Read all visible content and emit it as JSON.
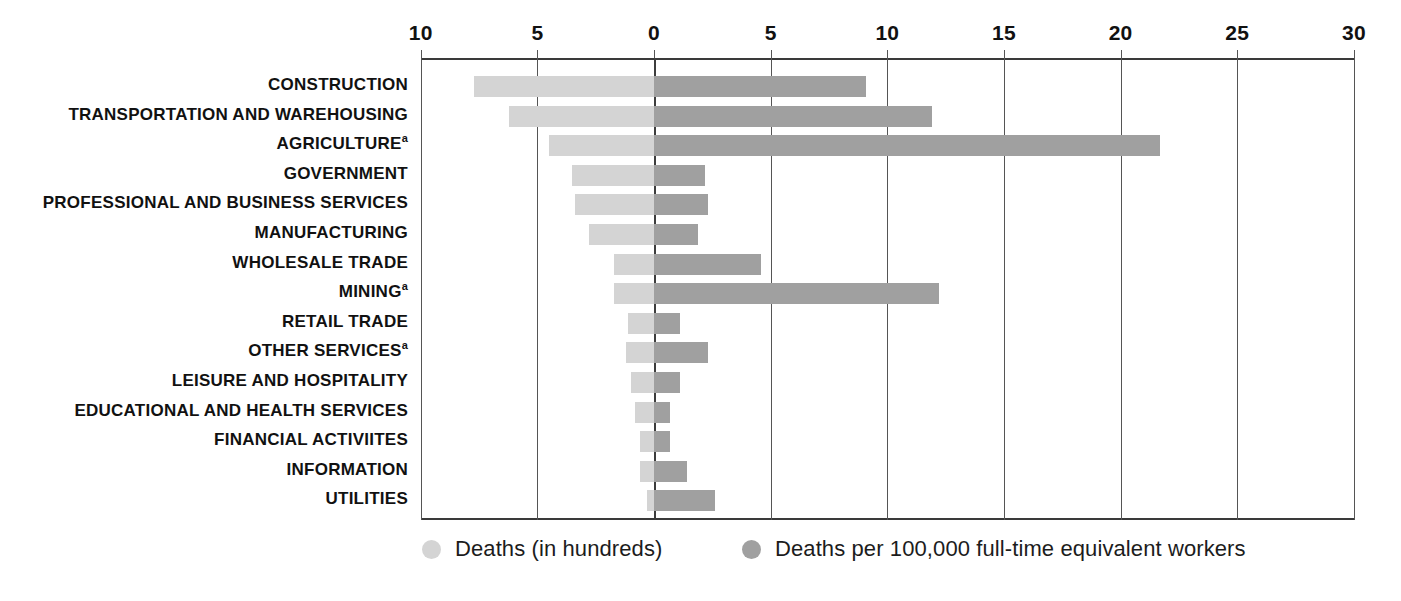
{
  "chart_data": {
    "type": "bar",
    "title": "",
    "subtitle": "",
    "xlabel": "",
    "ylabel": "",
    "orientation": "horizontal",
    "style": "bidirectional",
    "grid": true,
    "legend_position": "bottom",
    "axis": {
      "tick_labels": [
        "10",
        "5",
        "0",
        "5",
        "10",
        "15",
        "20",
        "25",
        "30"
      ],
      "tick_values": [
        -10,
        -5,
        0,
        5,
        10,
        15,
        20,
        25,
        30
      ],
      "left_axis_range": [
        10,
        0
      ],
      "right_axis_range": [
        0,
        30
      ]
    },
    "colors": {
      "left_series": "#d4d4d4",
      "right_series": "#a0a0a0",
      "axis": "#3a3a3a",
      "gridline": "#555555",
      "text": "#111111"
    },
    "categories": [
      "CONSTRUCTION",
      "TRANSPORTATION AND WAREHOUSING",
      "AGRICULTURE",
      "GOVERNMENT",
      "PROFESSIONAL AND BUSINESS SERVICES",
      "MANUFACTURING",
      "WHOLESALE TRADE",
      "MINING",
      "RETAIL TRADE",
      "OTHER SERVICES",
      "LEISURE AND HOSPITALITY",
      "EDUCATIONAL AND HEALTH SERVICES",
      "FINANCIAL ACTIVIITES",
      "INFORMATION",
      "UTILITIES"
    ],
    "category_footnotes": [
      "",
      "",
      "a",
      "",
      "",
      "",
      "",
      "a",
      "",
      "a",
      "",
      "",
      "",
      "",
      ""
    ],
    "series": [
      {
        "name": "Deaths (in hundreds)",
        "color": "#d4d4d4",
        "axis": "left",
        "values": [
          7.7,
          6.2,
          4.5,
          3.5,
          3.4,
          2.8,
          1.7,
          1.7,
          1.1,
          1.2,
          1.0,
          0.8,
          0.6,
          0.6,
          0.3
        ]
      },
      {
        "name": "Deaths per 100,000 full-time equivalent workers",
        "color": "#a0a0a0",
        "axis": "right",
        "values": [
          9.1,
          11.9,
          21.7,
          2.2,
          2.3,
          1.9,
          4.6,
          12.2,
          1.1,
          2.3,
          1.1,
          0.7,
          0.7,
          1.4,
          2.6
        ]
      }
    ]
  },
  "legend": {
    "items": [
      {
        "label": "Deaths (in hundreds)",
        "color": "#d4d4d4"
      },
      {
        "label": "Deaths per 100,000 full-time equivalent workers",
        "color": "#a0a0a0"
      }
    ]
  }
}
